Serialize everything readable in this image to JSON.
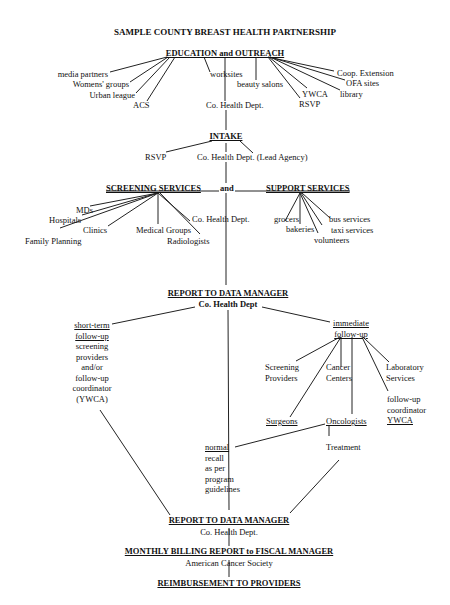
{
  "title": "SAMPLE COUNTY BREAST HEALTH PARTNERSHIP",
  "education": {
    "heading": "EDUCATION and OUTREACH",
    "left": [
      "media partners",
      "Womens' groups",
      "Urban league",
      "ACS"
    ],
    "center": [
      "worksites",
      "beauty salons",
      "Co. Health Dept."
    ],
    "right": [
      "Coop. Extension",
      "OFA sites",
      "library",
      "YWCA",
      "RSVP"
    ]
  },
  "intake": {
    "heading": "INTAKE",
    "items": [
      "RSVP",
      "Co. Health Dept. (Lead Agency)"
    ]
  },
  "services": {
    "screening_heading": "SCREENING SERVICES",
    "and": "and",
    "support_heading": "SUPPORT SERVICES",
    "screening": [
      "MDs",
      "Hospitals",
      "Clinics",
      "Family Planning",
      "Medical Groups",
      "Radiologists",
      "Co. Health Dept."
    ],
    "support": [
      "grocers",
      "bakeries",
      "volunteers",
      "bus services",
      "taxi services"
    ]
  },
  "report1": {
    "heading": "REPORT TO DATA MANAGER",
    "sub": "Co. Health Dept"
  },
  "short_term": {
    "heading1": "short-term",
    "heading2": "follow-up",
    "lines": [
      "screening",
      "providers",
      "and/or",
      "follow-up",
      "coordinator",
      "(YWCA)"
    ]
  },
  "immediate": {
    "heading1": "immediate",
    "heading2": "follow-up",
    "screening_providers": [
      "Screening",
      "Providers"
    ],
    "cancer_centers": [
      "Cancer",
      "Centers"
    ],
    "laboratory": [
      "Laboratory",
      "Services"
    ],
    "coordinator": [
      "follow-up",
      "coordinator",
      "YWCA"
    ],
    "surgeons": "Surgeons",
    "oncologists": "Oncologists",
    "treatment": "Treatment"
  },
  "normal": {
    "heading": "normal",
    "lines": [
      "recall",
      "as per",
      "program",
      "guidelines"
    ]
  },
  "report2": {
    "heading": "REPORT TO DATA MANAGER",
    "sub": "Co. Health Dept."
  },
  "billing": {
    "heading": "MONTHLY BILLING REPORT to FISCAL MANAGER",
    "sub": "American Cancer Society"
  },
  "reimbursement": {
    "heading": "REIMBURSEMENT TO PROVIDERS"
  }
}
